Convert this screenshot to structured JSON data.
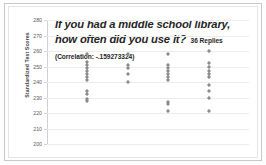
{
  "chart_data": {
    "type": "scatter",
    "title": "If you had a middle school library, how often did you use it?",
    "subtitle": "36 Replies  (Correlation: -.159273324)",
    "replies_count": "36 Replies",
    "correlation_label": "(Correlation: -.159273324)",
    "correlation": -0.159273324,
    "xlabel": "",
    "ylabel": "Standardized Test Scores",
    "ylim": [
      200,
      280
    ],
    "ytick_labels": [
      "280",
      "270",
      "260",
      "250",
      "240",
      "230",
      "220",
      "210",
      "200"
    ],
    "yticks": [
      280,
      270,
      260,
      250,
      240,
      230,
      220,
      210,
      200
    ],
    "xlim": [
      0,
      5
    ],
    "xtick_labels": [],
    "grid": true,
    "legend": false,
    "marker_color": "#8c8c8c",
    "marker_shape": "diamond",
    "series": [
      {
        "name": "Response 1",
        "x": 1,
        "values": [
          258,
          253,
          251,
          249,
          247,
          245,
          243,
          241,
          234,
          232,
          229,
          228
        ]
      },
      {
        "name": "Response 2",
        "x": 2,
        "values": [
          258,
          251,
          249,
          245,
          240
        ]
      },
      {
        "name": "Response 3",
        "x": 3,
        "values": [
          258,
          251,
          249,
          247,
          245,
          243,
          241,
          227,
          226,
          221
        ]
      },
      {
        "name": "Response 4",
        "x": 4,
        "values": [
          260,
          252,
          250,
          247,
          245,
          243,
          238,
          234,
          230,
          221
        ]
      }
    ]
  }
}
